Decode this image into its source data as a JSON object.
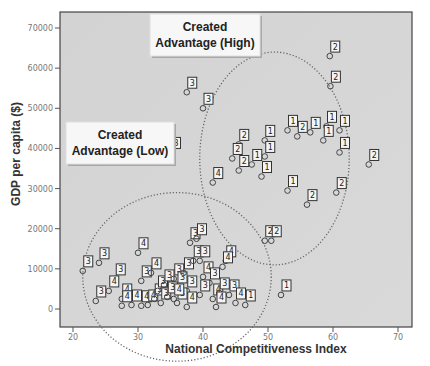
{
  "chart_data": {
    "type": "scatter",
    "title": "",
    "xlabel": "National Competitiveness Index",
    "ylabel": "GDP per capita ($)",
    "xlim": [
      18,
      72
    ],
    "ylim": [
      -4000,
      74000
    ],
    "x_ticks": [
      20,
      30,
      40,
      50,
      60,
      70
    ],
    "y_ticks": [
      0,
      10000,
      20000,
      30000,
      40000,
      50000,
      60000,
      70000
    ],
    "grid": false,
    "legend": null,
    "background": "#d6d6d6",
    "annotations": [
      {
        "text": "Created Advantage (High)",
        "lines": [
          "Created",
          "Advantage (High)"
        ]
      },
      {
        "text": "Created Advantage (Low)",
        "lines": [
          "Created",
          "Advantage (Low)"
        ]
      }
    ],
    "clusters": [
      {
        "name": "Created Advantage (High)",
        "shape": "dotted ellipse",
        "center": [
          51,
          37500
        ],
        "radius_x": 11.5,
        "radius_y": 26500
      },
      {
        "name": "Created Advantage (Low)",
        "shape": "dotted ellipse",
        "center": [
          36,
          8000
        ],
        "radius_x": 14.5,
        "radius_y": 21000
      }
    ],
    "series": [
      {
        "name": "countries",
        "point_label_field": "group",
        "points": [
          {
            "x": 59.5,
            "y": 63000,
            "group": 2
          },
          {
            "x": 59.6,
            "y": 55500,
            "group": 2
          },
          {
            "x": 37.5,
            "y": 54000,
            "group": 3
          },
          {
            "x": 40.0,
            "y": 50000,
            "group": 3
          },
          {
            "x": 53.0,
            "y": 44500,
            "group": 1
          },
          {
            "x": 56.5,
            "y": 44000,
            "group": 1
          },
          {
            "x": 59.0,
            "y": 45500,
            "group": 1
          },
          {
            "x": 61.0,
            "y": 44500,
            "group": 1
          },
          {
            "x": 58.5,
            "y": 42000,
            "group": 1
          },
          {
            "x": 54.5,
            "y": 43000,
            "group": 2
          },
          {
            "x": 49.5,
            "y": 42000,
            "group": 1
          },
          {
            "x": 45.5,
            "y": 41000,
            "group": 2
          },
          {
            "x": 44.5,
            "y": 37500,
            "group": 2
          },
          {
            "x": 49.5,
            "y": 38000,
            "group": 1
          },
          {
            "x": 61.0,
            "y": 39000,
            "group": 1
          },
          {
            "x": 47.5,
            "y": 36000,
            "group": 1
          },
          {
            "x": 45.5,
            "y": 34500,
            "group": 2
          },
          {
            "x": 49.0,
            "y": 33000,
            "group": 1
          },
          {
            "x": 41.5,
            "y": 31500,
            "group": 4
          },
          {
            "x": 53.0,
            "y": 29500,
            "group": 1
          },
          {
            "x": 56.0,
            "y": 26000,
            "group": 2
          },
          {
            "x": 60.5,
            "y": 29000,
            "group": 2
          },
          {
            "x": 65.5,
            "y": 36000,
            "group": 2
          },
          {
            "x": 35.0,
            "y": 39000,
            "group": 3
          },
          {
            "x": 49.5,
            "y": 17000,
            "group": 2
          },
          {
            "x": 50.5,
            "y": 17000,
            "group": 2
          },
          {
            "x": 52.0,
            "y": 3500,
            "group": 1
          },
          {
            "x": 21.5,
            "y": 9500,
            "group": 3
          },
          {
            "x": 24.0,
            "y": 11500,
            "group": 3
          },
          {
            "x": 26.5,
            "y": 7500,
            "group": 3
          },
          {
            "x": 30.0,
            "y": 14000,
            "group": 4
          },
          {
            "x": 25.5,
            "y": 4500,
            "group": 4
          },
          {
            "x": 23.5,
            "y": 2000,
            "group": 3
          },
          {
            "x": 27.5,
            "y": 2500,
            "group": 4
          },
          {
            "x": 27.5,
            "y": 800,
            "group": 4
          },
          {
            "x": 29.0,
            "y": 1000,
            "group": 4
          },
          {
            "x": 30.5,
            "y": 800,
            "group": 4
          },
          {
            "x": 31.5,
            "y": 1000,
            "group": 4
          },
          {
            "x": 32.5,
            "y": 2500,
            "group": 3
          },
          {
            "x": 30.5,
            "y": 7000,
            "group": 3
          },
          {
            "x": 32.0,
            "y": 9000,
            "group": 4
          },
          {
            "x": 33.0,
            "y": 4500,
            "group": 3
          },
          {
            "x": 33.5,
            "y": 1500,
            "group": 3
          },
          {
            "x": 34.0,
            "y": 6000,
            "group": 3
          },
          {
            "x": 35.5,
            "y": 7500,
            "group": 3
          },
          {
            "x": 36.0,
            "y": 5500,
            "group": 3
          },
          {
            "x": 37.0,
            "y": 9000,
            "group": 3
          },
          {
            "x": 37.5,
            "y": 4500,
            "group": 3
          },
          {
            "x": 38.0,
            "y": 16500,
            "group": 3
          },
          {
            "x": 39.0,
            "y": 17500,
            "group": 3
          },
          {
            "x": 38.5,
            "y": 12000,
            "group": 3
          },
          {
            "x": 39.5,
            "y": 12000,
            "group": 3
          },
          {
            "x": 40.0,
            "y": 8000,
            "group": 4
          },
          {
            "x": 41.0,
            "y": 6500,
            "group": 3
          },
          {
            "x": 39.5,
            "y": 3500,
            "group": 3
          },
          {
            "x": 41.5,
            "y": 2500,
            "group": 4
          },
          {
            "x": 42.5,
            "y": 4000,
            "group": 3
          },
          {
            "x": 43.5,
            "y": 12000,
            "group": 4
          },
          {
            "x": 43.0,
            "y": 10500,
            "group": 4
          },
          {
            "x": 44.0,
            "y": 3500,
            "group": 3
          },
          {
            "x": 45.0,
            "y": 1500,
            "group": 4
          },
          {
            "x": 46.5,
            "y": 1000,
            "group": 1
          },
          {
            "x": 36.0,
            "y": 1500,
            "group": 3
          },
          {
            "x": 37.5,
            "y": 500,
            "group": 4
          },
          {
            "x": 34.5,
            "y": 3000,
            "group": 3
          },
          {
            "x": 35.5,
            "y": 2500,
            "group": 4
          },
          {
            "x": 42.0,
            "y": 500,
            "group": 4
          }
        ]
      }
    ]
  }
}
